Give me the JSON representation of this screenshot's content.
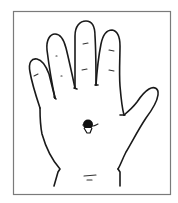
{
  "figure": {
    "description": "Line drawing of an open right palm with a marked point at the center of the palm",
    "marker": {
      "label": "palm-center-point",
      "color": "#111111"
    },
    "colors": {
      "background": "#ffffff",
      "frame": "#7a7a7a",
      "outline": "#1a1a1a"
    }
  }
}
